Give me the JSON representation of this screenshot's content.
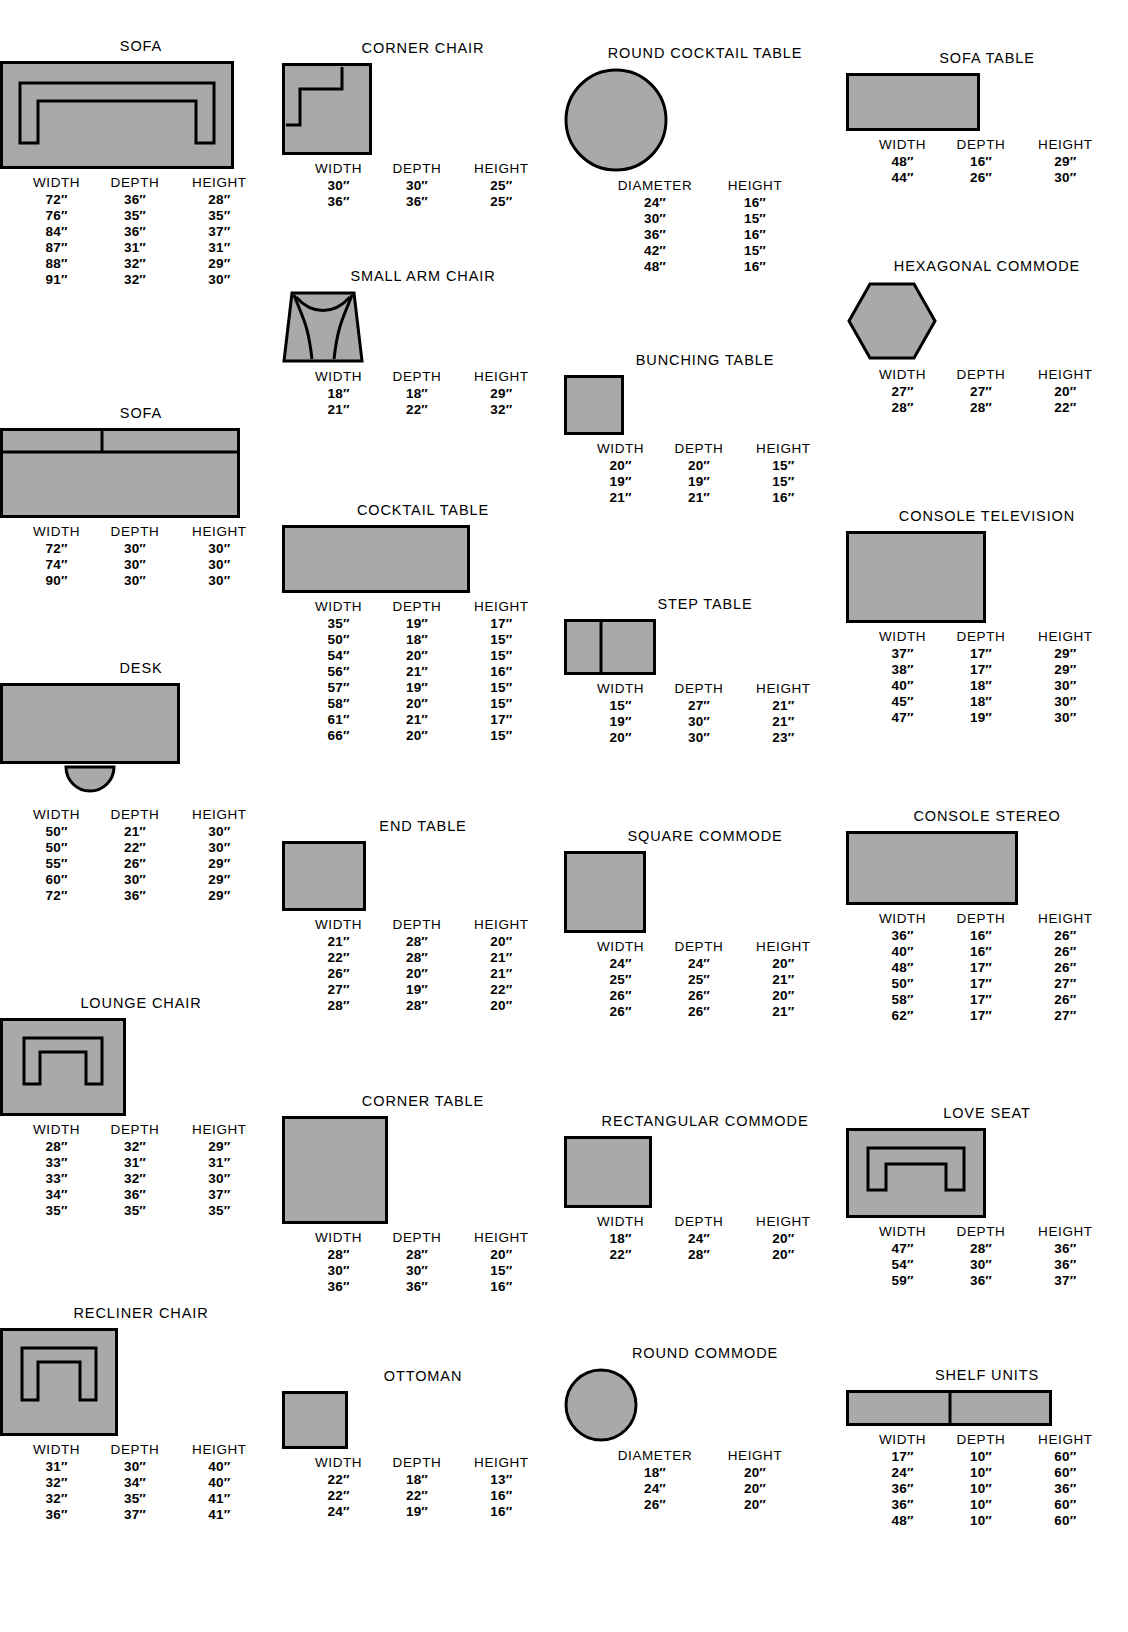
{
  "page": {
    "fill_color": "#a9a9a9",
    "stroke_color": "#000000",
    "background": "#ffffff"
  },
  "headers": {
    "width": "WIDTH",
    "depth": "DEPTH",
    "height": "HEIGHT",
    "diameter": "DIAMETER"
  },
  "items": [
    {
      "key": "sofa-1",
      "title": "SOFA",
      "shape": "sofa-arms",
      "columns": [
        "WIDTH",
        "DEPTH",
        "HEIGHT"
      ],
      "rows": [
        [
          "72″",
          "36″",
          "28″"
        ],
        [
          "76″",
          "35″",
          "35″"
        ],
        [
          "84″",
          "36″",
          "37″"
        ],
        [
          "87″",
          "31″",
          "31″"
        ],
        [
          "88″",
          "32″",
          "29″"
        ],
        [
          "91″",
          "32″",
          "30″"
        ]
      ]
    },
    {
      "key": "sofa-2",
      "title": "SOFA",
      "shape": "sofa-plain",
      "columns": [
        "WIDTH",
        "DEPTH",
        "HEIGHT"
      ],
      "rows": [
        [
          "72″",
          "30″",
          "30″"
        ],
        [
          "74″",
          "30″",
          "30″"
        ],
        [
          "90″",
          "30″",
          "30″"
        ]
      ]
    },
    {
      "key": "desk",
      "title": "DESK",
      "shape": "desk",
      "columns": [
        "WIDTH",
        "DEPTH",
        "HEIGHT"
      ],
      "rows": [
        [
          "50″",
          "21″",
          "30″"
        ],
        [
          "50″",
          "22″",
          "30″"
        ],
        [
          "55″",
          "26″",
          "29″"
        ],
        [
          "60″",
          "30″",
          "29″"
        ],
        [
          "72″",
          "36″",
          "29″"
        ]
      ]
    },
    {
      "key": "lounge-chair",
      "title": "LOUNGE CHAIR",
      "shape": "lounge-chair",
      "columns": [
        "WIDTH",
        "DEPTH",
        "HEIGHT"
      ],
      "rows": [
        [
          "28″",
          "32″",
          "29″"
        ],
        [
          "33″",
          "31″",
          "31″"
        ],
        [
          "33″",
          "32″",
          "30″"
        ],
        [
          "34″",
          "36″",
          "37″"
        ],
        [
          "35″",
          "35″",
          "35″"
        ]
      ]
    },
    {
      "key": "recliner-chair",
      "title": "RECLINER CHAIR",
      "shape": "recliner-chair",
      "columns": [
        "WIDTH",
        "DEPTH",
        "HEIGHT"
      ],
      "rows": [
        [
          "31″",
          "30″",
          "40″"
        ],
        [
          "32″",
          "34″",
          "40″"
        ],
        [
          "32″",
          "35″",
          "41″"
        ],
        [
          "36″",
          "37″",
          "41″"
        ]
      ]
    },
    {
      "key": "corner-chair",
      "title": "CORNER CHAIR",
      "shape": "corner-chair",
      "columns": [
        "WIDTH",
        "DEPTH",
        "HEIGHT"
      ],
      "rows": [
        [
          "30″",
          "30″",
          "25″"
        ],
        [
          "36″",
          "36″",
          "25″"
        ]
      ]
    },
    {
      "key": "small-arm-chair",
      "title": "SMALL ARM CHAIR",
      "shape": "small-arm-chair",
      "columns": [
        "WIDTH",
        "DEPTH",
        "HEIGHT"
      ],
      "rows": [
        [
          "18″",
          "18″",
          "29″"
        ],
        [
          "21″",
          "22″",
          "32″"
        ]
      ]
    },
    {
      "key": "cocktail-table",
      "title": "COCKTAIL TABLE",
      "shape": "rect-wide",
      "columns": [
        "WIDTH",
        "DEPTH",
        "HEIGHT"
      ],
      "rows": [
        [
          "35″",
          "19″",
          "17″"
        ],
        [
          "50″",
          "18″",
          "15″"
        ],
        [
          "54″",
          "20″",
          "15″"
        ],
        [
          "56″",
          "21″",
          "16″"
        ],
        [
          "57″",
          "19″",
          "15″"
        ],
        [
          "58″",
          "20″",
          "15″"
        ],
        [
          "61″",
          "21″",
          "17″"
        ],
        [
          "66″",
          "20″",
          "15″"
        ]
      ]
    },
    {
      "key": "end-table",
      "title": "END TABLE",
      "shape": "rect-small",
      "columns": [
        "WIDTH",
        "DEPTH",
        "HEIGHT"
      ],
      "rows": [
        [
          "21″",
          "28″",
          "20″"
        ],
        [
          "22″",
          "28″",
          "21″"
        ],
        [
          "26″",
          "20″",
          "21″"
        ],
        [
          "27″",
          "19″",
          "22″"
        ],
        [
          "28″",
          "28″",
          "20″"
        ]
      ]
    },
    {
      "key": "corner-table",
      "title": "CORNER TABLE",
      "shape": "square-large",
      "columns": [
        "WIDTH",
        "DEPTH",
        "HEIGHT"
      ],
      "rows": [
        [
          "28″",
          "28″",
          "20″"
        ],
        [
          "30″",
          "30″",
          "15″"
        ],
        [
          "36″",
          "36″",
          "16″"
        ]
      ]
    },
    {
      "key": "ottoman",
      "title": "OTTOMAN",
      "shape": "rect-ottoman",
      "columns": [
        "WIDTH",
        "DEPTH",
        "HEIGHT"
      ],
      "rows": [
        [
          "22″",
          "18″",
          "13″"
        ],
        [
          "22″",
          "22″",
          "16″"
        ],
        [
          "24″",
          "19″",
          "16″"
        ]
      ]
    },
    {
      "key": "round-cocktail-table",
      "title": "ROUND COCKTAIL TABLE",
      "shape": "circle-large",
      "columns": [
        "DIAMETER",
        "HEIGHT"
      ],
      "rows": [
        [
          "24″",
          "16″"
        ],
        [
          "30″",
          "15″"
        ],
        [
          "36″",
          "16″"
        ],
        [
          "42″",
          "15″"
        ],
        [
          "48″",
          "16″"
        ]
      ]
    },
    {
      "key": "bunching-table",
      "title": "BUNCHING TABLE",
      "shape": "square-small",
      "columns": [
        "WIDTH",
        "DEPTH",
        "HEIGHT"
      ],
      "rows": [
        [
          "20″",
          "20″",
          "15″"
        ],
        [
          "19″",
          "19″",
          "15″"
        ],
        [
          "21″",
          "21″",
          "16″"
        ]
      ]
    },
    {
      "key": "step-table",
      "title": "STEP TABLE",
      "shape": "step-table",
      "columns": [
        "WIDTH",
        "DEPTH",
        "HEIGHT"
      ],
      "rows": [
        [
          "15″",
          "27″",
          "21″"
        ],
        [
          "19″",
          "30″",
          "21″"
        ],
        [
          "20″",
          "30″",
          "23″"
        ]
      ]
    },
    {
      "key": "square-commode",
      "title": "SQUARE COMMODE",
      "shape": "square-med",
      "columns": [
        "WIDTH",
        "DEPTH",
        "HEIGHT"
      ],
      "rows": [
        [
          "24″",
          "24″",
          "20″"
        ],
        [
          "25″",
          "25″",
          "21″"
        ],
        [
          "26″",
          "26″",
          "20″"
        ],
        [
          "26″",
          "26″",
          "21″"
        ]
      ]
    },
    {
      "key": "rectangular-commode",
      "title": "RECTANGULAR COMMODE",
      "shape": "rect-commode",
      "columns": [
        "WIDTH",
        "DEPTH",
        "HEIGHT"
      ],
      "rows": [
        [
          "18″",
          "24″",
          "20″"
        ],
        [
          "22″",
          "28″",
          "20″"
        ]
      ]
    },
    {
      "key": "round-commode",
      "title": "ROUND COMMODE",
      "shape": "circle-small",
      "columns": [
        "DIAMETER",
        "HEIGHT"
      ],
      "rows": [
        [
          "18″",
          "20″"
        ],
        [
          "24″",
          "20″"
        ],
        [
          "26″",
          "20″"
        ]
      ]
    },
    {
      "key": "sofa-table",
      "title": "SOFA TABLE",
      "shape": "rect-sofa-table",
      "columns": [
        "WIDTH",
        "DEPTH",
        "HEIGHT"
      ],
      "rows": [
        [
          "48″",
          "16″",
          "29″"
        ],
        [
          "44″",
          "26″",
          "30″"
        ]
      ]
    },
    {
      "key": "hexagonal-commode",
      "title": "HEXAGONAL COMMODE",
      "shape": "hexagon",
      "columns": [
        "WIDTH",
        "DEPTH",
        "HEIGHT"
      ],
      "rows": [
        [
          "27″",
          "27″",
          "20″"
        ],
        [
          "28″",
          "28″",
          "22″"
        ]
      ]
    },
    {
      "key": "console-television",
      "title": "CONSOLE TELEVISION",
      "shape": "rect-console-tv",
      "columns": [
        "WIDTH",
        "DEPTH",
        "HEIGHT"
      ],
      "rows": [
        [
          "37″",
          "17″",
          "29″"
        ],
        [
          "38″",
          "17″",
          "29″"
        ],
        [
          "40″",
          "18″",
          "30″"
        ],
        [
          "45″",
          "18″",
          "30″"
        ],
        [
          "47″",
          "19″",
          "30″"
        ]
      ]
    },
    {
      "key": "console-stereo",
      "title": "CONSOLE STEREO",
      "shape": "rect-console-stereo",
      "columns": [
        "WIDTH",
        "DEPTH",
        "HEIGHT"
      ],
      "rows": [
        [
          "36″",
          "16″",
          "26″"
        ],
        [
          "40″",
          "16″",
          "26″"
        ],
        [
          "48″",
          "17″",
          "26″"
        ],
        [
          "50″",
          "17″",
          "27″"
        ],
        [
          "58″",
          "17″",
          "26″"
        ],
        [
          "62″",
          "17″",
          "27″"
        ]
      ]
    },
    {
      "key": "love-seat",
      "title": "LOVE SEAT",
      "shape": "love-seat",
      "columns": [
        "WIDTH",
        "DEPTH",
        "HEIGHT"
      ],
      "rows": [
        [
          "47″",
          "28″",
          "36″"
        ],
        [
          "54″",
          "30″",
          "36″"
        ],
        [
          "59″",
          "36″",
          "37″"
        ]
      ]
    },
    {
      "key": "shelf-units",
      "title": "SHELF UNITS",
      "shape": "shelf-units",
      "columns": [
        "WIDTH",
        "DEPTH",
        "HEIGHT"
      ],
      "rows": [
        [
          "17″",
          "10″",
          "60″"
        ],
        [
          "24″",
          "10″",
          "60″"
        ],
        [
          "36″",
          "10″",
          "36″"
        ],
        [
          "36″",
          "10″",
          "60″"
        ],
        [
          "48″",
          "10″",
          "60″"
        ]
      ]
    }
  ],
  "layout": {
    "col1": [
      {
        "key": "sofa-1",
        "top": 38
      },
      {
        "key": "sofa-2",
        "top": 405
      },
      {
        "key": "desk",
        "top": 660
      },
      {
        "key": "lounge-chair",
        "top": 995
      },
      {
        "key": "recliner-chair",
        "top": 1305
      }
    ],
    "col2": [
      {
        "key": "corner-chair",
        "top": 40
      },
      {
        "key": "small-arm-chair",
        "top": 268
      },
      {
        "key": "cocktail-table",
        "top": 502
      },
      {
        "key": "end-table",
        "top": 818
      },
      {
        "key": "corner-table",
        "top": 1093
      },
      {
        "key": "ottoman",
        "top": 1368
      }
    ],
    "col3": [
      {
        "key": "round-cocktail-table",
        "top": 45
      },
      {
        "key": "bunching-table",
        "top": 352
      },
      {
        "key": "step-table",
        "top": 596
      },
      {
        "key": "square-commode",
        "top": 828
      },
      {
        "key": "rectangular-commode",
        "top": 1113
      },
      {
        "key": "round-commode",
        "top": 1345
      }
    ],
    "col4": [
      {
        "key": "sofa-table",
        "top": 50
      },
      {
        "key": "hexagonal-commode",
        "top": 258
      },
      {
        "key": "console-television",
        "top": 508
      },
      {
        "key": "console-stereo",
        "top": 808
      },
      {
        "key": "love-seat",
        "top": 1105
      },
      {
        "key": "shelf-units",
        "top": 1367
      }
    ]
  }
}
